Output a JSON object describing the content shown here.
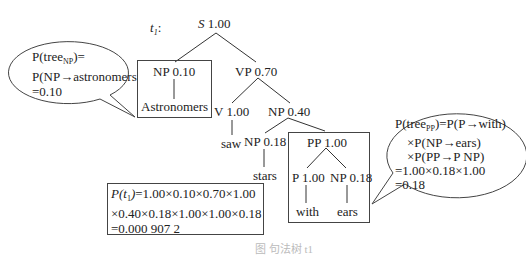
{
  "tree_label": "t",
  "tree_label_sub": "1",
  "tree_label_suffix": ":",
  "nodes": {
    "S": {
      "sym": "S",
      "prob": "1.00"
    },
    "NP1": {
      "label": "NP 0.10",
      "word": "Astronomers"
    },
    "VP": {
      "label": "VP 0.70"
    },
    "V": {
      "label": "V 1.00",
      "word": "saw"
    },
    "NP2": {
      "label": "NP 0.40"
    },
    "NP3": {
      "label": "NP 0.18",
      "word": "stars"
    },
    "PP": {
      "label": "PP 1.00"
    },
    "P": {
      "label": "P 1.00",
      "word": "with"
    },
    "NP4": {
      "label": "NP 0.18",
      "word": "ears"
    }
  },
  "bubble_np": {
    "line1_pre": "P(tree",
    "line1_sub": "NP",
    "line1_post": ")=",
    "line2": "P(NP→astronomers",
    "line3": "=0.10"
  },
  "bubble_pp": {
    "line1_pre": "P(tree",
    "line1_sub": "PP",
    "line1_post": ")=P(P→with)",
    "line2": "×P(NP→ears)",
    "line3": "×P(PP→P NP)",
    "line4": "=1.00×0.18×1.00",
    "line5": "=0.18"
  },
  "formula": {
    "lhs_p": "P(",
    "lhs_t": "t",
    "lhs_sub": "1",
    "lhs_close": ")",
    "line1_rest": "=1.00×0.10×0.70×1.00",
    "line2": "×0.40×0.18×1.00×1.00×0.18",
    "line3": "=0.000 907 2"
  },
  "caption": "图    句法树 t1"
}
